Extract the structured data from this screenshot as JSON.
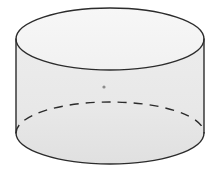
{
  "figure": {
    "name": "cylinder",
    "title": "Right circular cylinder",
    "background_color": "#ffffff",
    "stroke_color": "#2b2b2b",
    "top_face_fill": "#f4f4f4",
    "body_fill": "#e9e9e9",
    "body_fill_bottom": "#e2e2e2",
    "dot_color": "#8c8c8c",
    "stroke_width": 1.4,
    "dash_pattern": "9 7",
    "geometry": {
      "canvas_width": 220,
      "canvas_height": 179,
      "top_ellipse": {
        "center_x": 110,
        "center_y": 39,
        "radius_x": 94,
        "radius_y": 31
      },
      "bottom_ellipse": {
        "center_x": 110,
        "center_y": 133,
        "radius_x": 94,
        "radius_y": 31
      },
      "left_wall_x": 16,
      "right_wall_x": 204,
      "wall_top_y": 39,
      "wall_bottom_y": 133,
      "height": 94,
      "center_dot": {
        "x": 104,
        "y": 87,
        "radius": 1.6
      }
    },
    "parts": [
      {
        "id": "top-rim",
        "label": "Top circular rim (ellipse)",
        "style": "solid"
      },
      {
        "id": "left-wall",
        "label": "Left silhouette edge",
        "style": "solid"
      },
      {
        "id": "right-wall",
        "label": "Right silhouette edge",
        "style": "solid"
      },
      {
        "id": "bottom-front-arc",
        "label": "Front half of base circle",
        "style": "solid"
      },
      {
        "id": "bottom-back-arc",
        "label": "Hidden rear half of base circle",
        "style": "dashed"
      },
      {
        "id": "center-dot",
        "label": "Interior center mark",
        "style": "dot"
      }
    ]
  }
}
